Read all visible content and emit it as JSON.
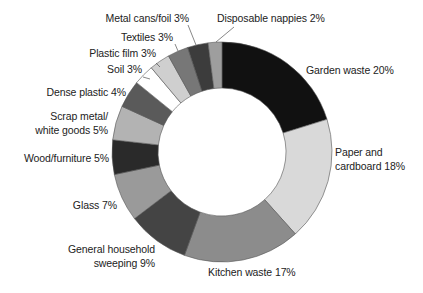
{
  "chart_data": {
    "type": "pie",
    "variant": "donut",
    "title": "",
    "unit": "%",
    "start_angle_deg": 0,
    "direction": "clockwise",
    "slices": [
      {
        "label": "Garden waste",
        "value": 20,
        "color": "#111111"
      },
      {
        "label": "Paper and cardboard",
        "value": 18,
        "color": "#d9d9d9"
      },
      {
        "label": "Kitchen waste",
        "value": 17,
        "color": "#8c8c8c"
      },
      {
        "label": "General household sweeping",
        "value": 9,
        "color": "#444444"
      },
      {
        "label": "Glass",
        "value": 7,
        "color": "#9a9a9a"
      },
      {
        "label": "Wood/furniture",
        "value": 5,
        "color": "#2a2a2a"
      },
      {
        "label": "Scrap metal/white goods",
        "value": 5,
        "color": "#b3b3b3"
      },
      {
        "label": "Dense plastic",
        "value": 4,
        "color": "#5a5a5a"
      },
      {
        "label": "Soil",
        "value": 3,
        "color": "#ffffff"
      },
      {
        "label": "Plastic film",
        "value": 3,
        "color": "#cfcfcf"
      },
      {
        "label": "Textiles",
        "value": 3,
        "color": "#777777"
      },
      {
        "label": "Metal cans/foil",
        "value": 3,
        "color": "#3c3c3c"
      },
      {
        "label": "Disposable nappies",
        "value": 2,
        "color": "#9e9e9e"
      }
    ]
  },
  "labels": {
    "garden": "Garden waste 20%",
    "paper_1": "Paper and",
    "paper_2": "cardboard 18%",
    "kitchen": "Kitchen waste 17%",
    "general_1": "General household",
    "general_2": "sweeping 9%",
    "glass": "Glass 7%",
    "wood": "Wood/furniture 5%",
    "scrap_1": "Scrap metal/",
    "scrap_2": "white goods 5%",
    "dense": "Dense plastic 4%",
    "soil": "Soil 3%",
    "plastic_film": "Plastic film 3%",
    "textiles": "Textiles 3%",
    "metal": "Metal cans/foil 3%",
    "nappies": "Disposable nappies 2%"
  }
}
